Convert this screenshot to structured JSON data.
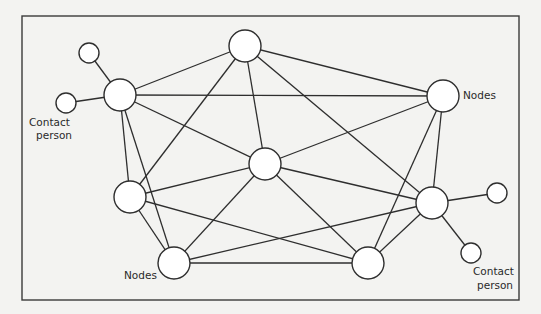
{
  "diagram": {
    "type": "network",
    "frame": {
      "x": 22,
      "y": 16,
      "width": 497,
      "height": 284
    },
    "nodes": [
      {
        "id": "A",
        "role": "node",
        "x": 120,
        "y": 95,
        "r": 16
      },
      {
        "id": "B",
        "role": "node",
        "x": 245,
        "y": 46,
        "r": 16
      },
      {
        "id": "C",
        "role": "node",
        "x": 443,
        "y": 96,
        "r": 16
      },
      {
        "id": "D",
        "role": "node",
        "x": 265,
        "y": 164,
        "r": 16
      },
      {
        "id": "E",
        "role": "node",
        "x": 130,
        "y": 197,
        "r": 16
      },
      {
        "id": "F",
        "role": "node",
        "x": 174,
        "y": 263,
        "r": 16
      },
      {
        "id": "G",
        "role": "node",
        "x": 368,
        "y": 263,
        "r": 16
      },
      {
        "id": "H",
        "role": "node",
        "x": 432,
        "y": 203,
        "r": 16
      },
      {
        "id": "P1",
        "role": "contact",
        "x": 89,
        "y": 53,
        "r": 10
      },
      {
        "id": "P2",
        "role": "contact",
        "x": 66,
        "y": 103,
        "r": 10
      },
      {
        "id": "P3",
        "role": "contact",
        "x": 497,
        "y": 193,
        "r": 10
      },
      {
        "id": "P4",
        "role": "contact",
        "x": 471,
        "y": 253,
        "r": 10
      }
    ],
    "edges": [
      [
        "A",
        "B"
      ],
      [
        "A",
        "C"
      ],
      [
        "A",
        "D"
      ],
      [
        "A",
        "E"
      ],
      [
        "A",
        "F"
      ],
      [
        "B",
        "C"
      ],
      [
        "B",
        "D"
      ],
      [
        "B",
        "E"
      ],
      [
        "B",
        "H"
      ],
      [
        "C",
        "D"
      ],
      [
        "C",
        "H"
      ],
      [
        "C",
        "G"
      ],
      [
        "D",
        "E"
      ],
      [
        "D",
        "F"
      ],
      [
        "D",
        "H"
      ],
      [
        "D",
        "G"
      ],
      [
        "E",
        "F"
      ],
      [
        "E",
        "G"
      ],
      [
        "F",
        "G"
      ],
      [
        "F",
        "H"
      ],
      [
        "G",
        "H"
      ],
      [
        "A",
        "P1"
      ],
      [
        "A",
        "P2"
      ],
      [
        "H",
        "P3"
      ],
      [
        "H",
        "P4"
      ]
    ],
    "labels": {
      "contact_left": {
        "line1": "Contact",
        "line2": "person"
      },
      "nodes_right": "Nodes",
      "nodes_bottom": "Nodes",
      "contact_right": {
        "line1": "Contact",
        "line2": "person"
      }
    }
  }
}
